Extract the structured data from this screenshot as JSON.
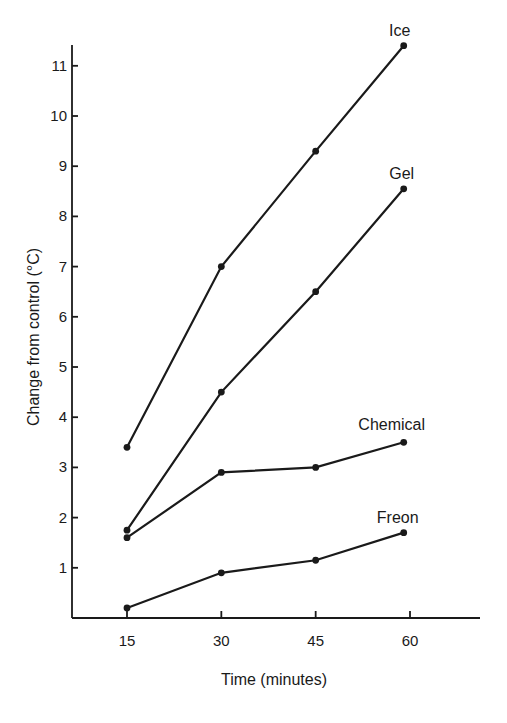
{
  "chart_data": {
    "type": "line",
    "title": "",
    "xlabel": "Time (minutes)",
    "ylabel": "Change from control (°C)",
    "x_ticks": [
      15,
      30,
      45,
      60
    ],
    "y_ticks": [
      1,
      2,
      3,
      4,
      5,
      6,
      7,
      8,
      9,
      10,
      11
    ],
    "xlim": [
      7,
      69
    ],
    "ylim": [
      0,
      11.5
    ],
    "grid": false,
    "legend": "inline labels at line ends",
    "series": [
      {
        "name": "Ice",
        "x": [
          15,
          30,
          45,
          59
        ],
        "values": [
          3.4,
          7.0,
          9.3,
          11.4
        ]
      },
      {
        "name": "Gel",
        "x": [
          15,
          30,
          45,
          59
        ],
        "values": [
          1.75,
          4.5,
          6.5,
          8.55
        ]
      },
      {
        "name": "Chemical",
        "x": [
          15,
          30,
          45,
          59
        ],
        "values": [
          1.6,
          2.9,
          3.0,
          3.5
        ]
      },
      {
        "name": "Freon",
        "x": [
          15,
          30,
          45,
          59
        ],
        "values": [
          0.2,
          0.9,
          1.15,
          1.7
        ]
      }
    ],
    "colors": {
      "line": "#1a1a1a",
      "background": "#ffffff"
    }
  }
}
